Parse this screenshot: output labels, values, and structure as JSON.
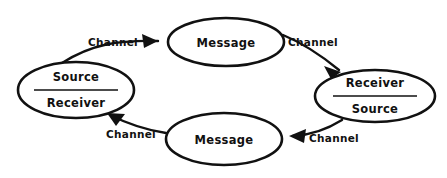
{
  "diagram": {
    "type": "cyclic-communication-model",
    "background_color": "#ffffff",
    "line_color": "#111111",
    "nodes": [
      {
        "id": "left-party",
        "shape": "ellipse",
        "cx": 76,
        "cy": 90,
        "rx": 58,
        "ry": 28,
        "stroke_width": 2.6,
        "divider": {
          "x1": 34,
          "x2": 118,
          "y": 90
        },
        "top_label": "Source",
        "bottom_label": "Receiver"
      },
      {
        "id": "top-message",
        "shape": "ellipse",
        "cx": 226,
        "cy": 42,
        "rx": 58,
        "ry": 24,
        "stroke_width": 2.6,
        "label": "Message"
      },
      {
        "id": "right-party",
        "shape": "ellipse",
        "cx": 375,
        "cy": 96,
        "rx": 60,
        "ry": 26,
        "stroke_width": 2.6,
        "divider": {
          "x1": 333,
          "x2": 417,
          "y": 96
        },
        "top_label": "Receiver",
        "bottom_label": "Source"
      },
      {
        "id": "bottom-message",
        "shape": "ellipse",
        "cx": 224,
        "cy": 139,
        "rx": 58,
        "ry": 26,
        "stroke_width": 2.6,
        "label": "Message"
      }
    ],
    "edges": [
      {
        "id": "left-to-top",
        "from": "left-party",
        "to": "top-message",
        "label": "Channel",
        "label_x": 113,
        "label_y": 43,
        "path": "M 62 63 C 92 44 118 40 158 41",
        "stroke_width": 2.4,
        "arrow": "M 158 41 L 142 34 L 144 48 Z"
      },
      {
        "id": "top-to-right",
        "from": "top-message",
        "to": "right-party",
        "label": "Channel",
        "label_x": 313,
        "label_y": 43,
        "path": "M 283 35 C 305 44 322 56 339 70",
        "stroke_width": 2.4,
        "arrow": "M 341 72 L 324 66 L 331 79 Z"
      },
      {
        "id": "right-to-bottom",
        "from": "right-party",
        "to": "bottom-message",
        "label": "Channel",
        "label_x": 334,
        "label_y": 139,
        "path": "M 342 120 C 326 130 312 135 293 136",
        "stroke_width": 2.4,
        "arrow": "M 289 136 L 306 129 L 304 143 Z"
      },
      {
        "id": "bottom-to-left",
        "from": "bottom-message",
        "to": "left-party",
        "label": "Channel",
        "label_x": 131,
        "label_y": 135,
        "path": "M 166 133 C 146 130 130 125 110 115",
        "stroke_width": 2.4,
        "arrow": "M 107 113 L 125 114 L 116 126 Z"
      }
    ]
  }
}
